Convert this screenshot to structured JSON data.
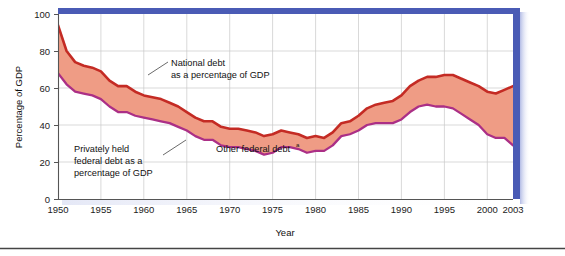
{
  "figure": {
    "background_color": "#ffffff",
    "frame_color": "#4a5bb5",
    "plot_border_color": "#555555",
    "grid_color": "#c9c9c9",
    "footer_rule_color": "#444444"
  },
  "chart_data": {
    "type": "area",
    "title": "",
    "subtitle": "",
    "xlabel": "Year",
    "ylabel": "Percentage of GDP",
    "xlim": [
      1950,
      2003
    ],
    "ylim": [
      0,
      100
    ],
    "yticks": [
      0,
      20,
      40,
      60,
      80,
      100
    ],
    "xticks": [
      1950,
      1955,
      1960,
      1965,
      1970,
      1975,
      1980,
      1985,
      1990,
      1995,
      2000,
      2003
    ],
    "xtick_labels": [
      "1950",
      "1955",
      "1960",
      "1965",
      "1970",
      "1975",
      "1980",
      "1985",
      "1990",
      "1995",
      "2000",
      "2003"
    ],
    "ytick_labels": [
      "0",
      "20",
      "40",
      "60",
      "80",
      "100"
    ],
    "grid": true,
    "grid_axis": "both",
    "legend": "none",
    "series_colors": {
      "national_debt_line": "#c42b24",
      "privately_held_line": "#ab2f86",
      "band_fill": "#ef9c85"
    },
    "x": [
      1950,
      1951,
      1952,
      1953,
      1954,
      1955,
      1956,
      1957,
      1958,
      1959,
      1960,
      1961,
      1962,
      1963,
      1964,
      1965,
      1966,
      1967,
      1968,
      1969,
      1970,
      1971,
      1972,
      1973,
      1974,
      1975,
      1976,
      1977,
      1978,
      1979,
      1980,
      1981,
      1982,
      1983,
      1984,
      1985,
      1986,
      1987,
      1988,
      1989,
      1990,
      1991,
      1992,
      1993,
      1994,
      1995,
      1996,
      1997,
      1998,
      1999,
      2000,
      2001,
      2002,
      2003
    ],
    "series": [
      {
        "name": "National debt as a percentage of GDP",
        "color": "#c42b24",
        "values": [
          94,
          80,
          74,
          72,
          71,
          69,
          64,
          61,
          61,
          58,
          56,
          55,
          54,
          52,
          50,
          47,
          44,
          42,
          42,
          39,
          38,
          38,
          37,
          36,
          34,
          35,
          37,
          36,
          35,
          33,
          34,
          33,
          36,
          41,
          42,
          45,
          49,
          51,
          52,
          53,
          56,
          61,
          64,
          66,
          66,
          67,
          67,
          65,
          63,
          61,
          58,
          57,
          59,
          61
        ]
      },
      {
        "name": "Privately held federal debt as a percentage of GDP",
        "color": "#ab2f86",
        "values": [
          68,
          62,
          58,
          57,
          56,
          54,
          50,
          47,
          47,
          45,
          44,
          43,
          42,
          41,
          39,
          37,
          34,
          32,
          32,
          29,
          28,
          28,
          27,
          26,
          24,
          25,
          28,
          28,
          27,
          25,
          26,
          26,
          29,
          34,
          35,
          37,
          40,
          41,
          41,
          41,
          43,
          47,
          50,
          51,
          50,
          50,
          49,
          46,
          43,
          40,
          35,
          33,
          33,
          29
        ]
      }
    ],
    "annotations": [
      {
        "id": "national-debt-annotation",
        "lines": [
          "National debt",
          "as a percentage of GDP"
        ],
        "x_px": 143,
        "y_px": 70
      },
      {
        "id": "privately-held-annotation",
        "lines": [
          "Privately held",
          "federal debt as a",
          "percentage of GDP"
        ],
        "x_px": 70,
        "y_px": 150
      },
      {
        "id": "other-federal-debt-annotation",
        "text": "Other federal debt",
        "superscript": "a",
        "x_px": 215,
        "y_px": 152
      }
    ]
  }
}
